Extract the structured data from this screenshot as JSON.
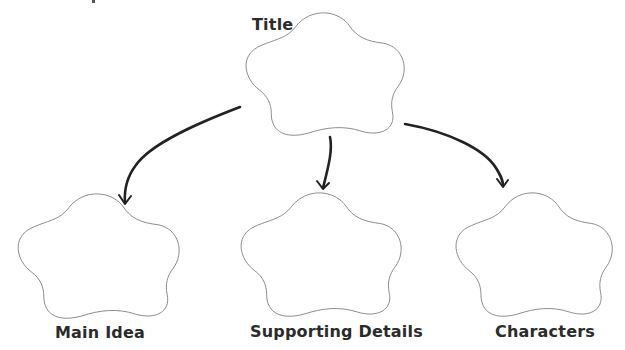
{
  "diagram": {
    "type": "graphic-organizer",
    "colors": {
      "outline": "#8a8a8a",
      "arrow": "#222222",
      "label": "#2b2b2b",
      "background": "#ffffff"
    },
    "nodes": [
      {
        "id": "title",
        "label": "Title",
        "shape": "cloud-5-lobe",
        "bbox": {
          "x": 242,
          "y": 12,
          "w": 166,
          "h": 125
        },
        "label_pos": {
          "x": 252,
          "y": 17,
          "size": 16
        }
      },
      {
        "id": "main-idea",
        "label": "Main Idea",
        "shape": "cloud-5-lobe",
        "bbox": {
          "x": 14,
          "y": 193,
          "w": 169,
          "h": 127
        },
        "label_pos": {
          "x": 55,
          "y": 325,
          "size": 16
        }
      },
      {
        "id": "supporting-details",
        "label": "Supporting Details",
        "shape": "cloud-5-lobe",
        "bbox": {
          "x": 237,
          "y": 192,
          "w": 168,
          "h": 126
        },
        "label_pos": {
          "x": 250,
          "y": 324,
          "size": 16
        }
      },
      {
        "id": "characters",
        "label": "Characters",
        "shape": "cloud-5-lobe",
        "bbox": {
          "x": 452,
          "y": 192,
          "w": 164,
          "h": 126
        },
        "label_pos": {
          "x": 495,
          "y": 324,
          "size": 16
        }
      }
    ],
    "edges": [
      {
        "from": "title",
        "to": "main-idea",
        "direction": "down-left"
      },
      {
        "from": "title",
        "to": "supporting-details",
        "direction": "down"
      },
      {
        "from": "title",
        "to": "characters",
        "direction": "down-right"
      }
    ]
  }
}
